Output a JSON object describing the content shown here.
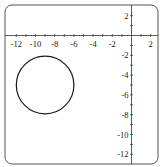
{
  "chart_data": {
    "type": "line",
    "title": "",
    "xlabel": "",
    "ylabel": "",
    "xlim": [
      -13,
      3
    ],
    "ylim": [
      -13,
      3
    ],
    "grid": false,
    "x_ticks": [
      "-12",
      "-10",
      "-8",
      "-6",
      "-4",
      "-2",
      "2"
    ],
    "y_ticks": [
      "2",
      "-2",
      "-4",
      "-6",
      "-8",
      "-10",
      "-12"
    ],
    "series": [
      {
        "name": "circle",
        "shape": "circle",
        "center": [
          -9,
          -5
        ],
        "radius": 3,
        "color": "#1a1a1a"
      }
    ]
  }
}
